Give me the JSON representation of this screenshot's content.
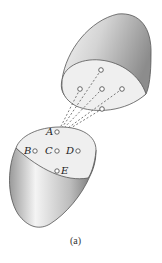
{
  "figure": {
    "caption": "(a)",
    "upper_surface": {
      "points": [
        {
          "x": 101,
          "y": 70
        },
        {
          "x": 80,
          "y": 89
        },
        {
          "x": 102,
          "y": 89
        },
        {
          "x": 122,
          "y": 89
        },
        {
          "x": 102,
          "y": 109
        }
      ]
    },
    "lower_surface": {
      "labels": [
        {
          "name": "A",
          "text": "A"
        },
        {
          "name": "B",
          "text": "B"
        },
        {
          "name": "C",
          "text": "C"
        },
        {
          "name": "D",
          "text": "D"
        },
        {
          "name": "E",
          "text": "E"
        }
      ]
    },
    "colors": {
      "stroke": "#555555",
      "face_fill": "#efefef",
      "shade_dark": "#8a8a8a",
      "shade_light": "#f4f4f4"
    }
  }
}
